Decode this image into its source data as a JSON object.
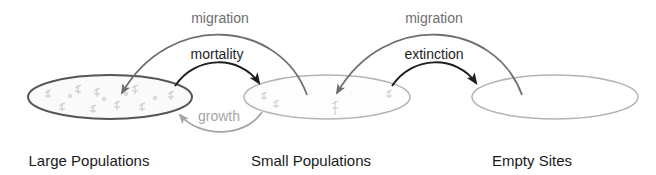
{
  "diagram": {
    "nodes": [
      {
        "id": "large",
        "label": "Large Populations"
      },
      {
        "id": "small",
        "label": "Small Populations"
      },
      {
        "id": "empty",
        "label": "Empty Sites"
      }
    ],
    "edges": [
      {
        "id": "migration-1",
        "label": "migration",
        "from": "small",
        "to": "large"
      },
      {
        "id": "mortality",
        "label": "mortality",
        "from": "large",
        "to": "small"
      },
      {
        "id": "growth",
        "label": "growth",
        "from": "small",
        "to": "large"
      },
      {
        "id": "migration-2",
        "label": "migration",
        "from": "empty",
        "to": "small"
      },
      {
        "id": "extinction",
        "label": "extinction",
        "from": "small",
        "to": "empty"
      }
    ],
    "colors": {
      "migration": "#6e6e6e",
      "mortality": "#1e1e1e",
      "extinction": "#1e1e1e",
      "growth": "#a5a5a5",
      "large_outline": "#555555",
      "small_outline": "#b4b4b4",
      "empty_outline": "#b4b4b4",
      "plant_marks": "#c4c4c4",
      "node_label": "#1a1a1a"
    }
  }
}
